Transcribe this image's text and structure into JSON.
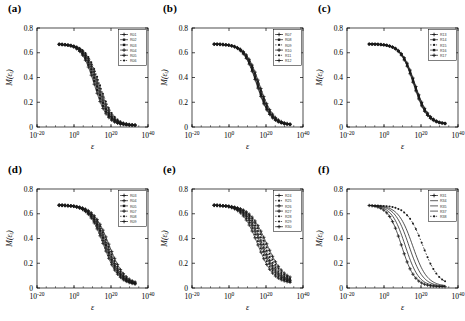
{
  "figure": {
    "background": "#ffffff",
    "axis_color": "#000000",
    "curve_color": "#1a1a1a",
    "panel_count": 6
  },
  "chart_data": [
    {
      "type": "line",
      "panel": "(a)",
      "title": "",
      "xlabel": "ε",
      "ylabel": "M(εᵢ)",
      "xscale": "log",
      "xlim": [
        1e-20,
        1e+40
      ],
      "ylim": [
        0,
        0.8
      ],
      "xticks": [
        1e-20,
        1,
        1e+20,
        1e+40
      ],
      "xticklabels": [
        "10^-20",
        "10^0",
        "10^20",
        "10^40"
      ],
      "yticks": [
        0,
        0.2,
        0.4,
        0.6,
        0.8
      ],
      "yticklabels": [
        "0",
        "0.2",
        "0.4",
        "0.6",
        "0.8"
      ],
      "grid": false,
      "legend_position": "upper right",
      "plateau": 0.67,
      "series": [
        {
          "name": "R01",
          "marker": "plus",
          "midpoint_log10": 11.0,
          "width_log10": 7.0,
          "plateau": 0.672,
          "tail": 0.012
        },
        {
          "name": "R02",
          "marker": "square",
          "midpoint_log10": 11.6,
          "width_log10": 7.1,
          "plateau": 0.67,
          "tail": 0.012
        },
        {
          "name": "R03",
          "marker": "square",
          "midpoint_log10": 12.2,
          "width_log10": 7.2,
          "plateau": 0.671,
          "tail": 0.013
        },
        {
          "name": "R04",
          "marker": "plus",
          "midpoint_log10": 12.8,
          "width_log10": 7.2,
          "plateau": 0.669,
          "tail": 0.013
        },
        {
          "name": "R05",
          "marker": "plus",
          "midpoint_log10": 13.4,
          "width_log10": 7.3,
          "plateau": 0.67,
          "tail": 0.014
        },
        {
          "name": "R06",
          "marker": "dot",
          "midpoint_log10": 14.0,
          "width_log10": 7.4,
          "plateau": 0.668,
          "tail": 0.014
        }
      ]
    },
    {
      "type": "line",
      "panel": "(b)",
      "title": "",
      "xlabel": "ε",
      "ylabel": "M(εᵢ)",
      "xscale": "log",
      "xlim": [
        1e-20,
        1e+40
      ],
      "ylim": [
        0,
        0.8
      ],
      "xticks": [
        1e-20,
        1,
        1e+20,
        1e+40
      ],
      "xticklabels": [
        "10^-20",
        "10^0",
        "10^20",
        "10^40"
      ],
      "yticks": [
        0,
        0.2,
        0.4,
        0.6,
        0.8
      ],
      "yticklabels": [
        "0",
        "0.2",
        "0.4",
        "0.6",
        "0.8"
      ],
      "grid": false,
      "legend_position": "upper right",
      "plateau": 0.67,
      "series": [
        {
          "name": "R07",
          "marker": "plus",
          "midpoint_log10": 15.0,
          "width_log10": 7.4,
          "plateau": 0.672,
          "tail": 0.014
        },
        {
          "name": "R08",
          "marker": "square",
          "midpoint_log10": 15.3,
          "width_log10": 7.4,
          "plateau": 0.671,
          "tail": 0.014
        },
        {
          "name": "R09",
          "marker": "dot",
          "midpoint_log10": 15.6,
          "width_log10": 7.5,
          "plateau": 0.67,
          "tail": 0.015
        },
        {
          "name": "R10",
          "marker": "plus",
          "midpoint_log10": 15.9,
          "width_log10": 7.5,
          "plateau": 0.67,
          "tail": 0.015
        },
        {
          "name": "R11",
          "marker": "dot",
          "midpoint_log10": 16.2,
          "width_log10": 7.5,
          "plateau": 0.669,
          "tail": 0.015
        },
        {
          "name": "R12",
          "marker": "plus",
          "midpoint_log10": 16.5,
          "width_log10": 7.6,
          "plateau": 0.669,
          "tail": 0.016
        }
      ]
    },
    {
      "type": "line",
      "panel": "(c)",
      "title": "",
      "xlabel": "ε",
      "ylabel": "M(εᵢ)",
      "xscale": "log",
      "xlim": [
        1e-20,
        1e+40
      ],
      "ylim": [
        0,
        0.8
      ],
      "xticks": [
        1e-20,
        1,
        1e+20,
        1e+40
      ],
      "xticklabels": [
        "10^-20",
        "10^0",
        "10^20",
        "10^40"
      ],
      "yticks": [
        0,
        0.2,
        0.4,
        0.6,
        0.8
      ],
      "yticklabels": [
        "0",
        "0.2",
        "0.4",
        "0.6",
        "0.8"
      ],
      "grid": false,
      "legend_position": "upper right",
      "plateau": 0.67,
      "series": [
        {
          "name": "R13",
          "marker": "plus",
          "midpoint_log10": 16.0,
          "width_log10": 7.3,
          "plateau": 0.672,
          "tail": 0.02
        },
        {
          "name": "R14",
          "marker": "square",
          "midpoint_log10": 16.2,
          "width_log10": 7.3,
          "plateau": 0.671,
          "tail": 0.021
        },
        {
          "name": "R15",
          "marker": "dot",
          "midpoint_log10": 16.4,
          "width_log10": 7.3,
          "plateau": 0.671,
          "tail": 0.021
        },
        {
          "name": "R16",
          "marker": "square",
          "midpoint_log10": 16.6,
          "width_log10": 7.4,
          "plateau": 0.67,
          "tail": 0.022
        },
        {
          "name": "R17",
          "marker": "plus",
          "midpoint_log10": 16.8,
          "width_log10": 7.4,
          "plateau": 0.67,
          "tail": 0.022
        }
      ]
    },
    {
      "type": "line",
      "panel": "(d)",
      "title": "",
      "xlabel": "ε",
      "ylabel": "M(εᵢ)",
      "xscale": "log",
      "xlim": [
        1e-20,
        1e+40
      ],
      "ylim": [
        0,
        0.8
      ],
      "xticks": [
        1e-20,
        1,
        1e+20,
        1e+40
      ],
      "xticklabels": [
        "10^-20",
        "10^0",
        "10^20",
        "10^40"
      ],
      "yticks": [
        0,
        0.2,
        0.4,
        0.6,
        0.8
      ],
      "yticklabels": [
        "0",
        "0.2",
        "0.4",
        "0.6",
        "0.8"
      ],
      "grid": false,
      "legend_position": "upper right",
      "plateau": 0.67,
      "series": [
        {
          "name": "R03",
          "marker": "plus",
          "midpoint_log10": 16.0,
          "width_log10": 8.2,
          "plateau": 0.672,
          "tail": 0.022
        },
        {
          "name": "R04",
          "marker": "plus",
          "midpoint_log10": 16.6,
          "width_log10": 8.3,
          "plateau": 0.671,
          "tail": 0.023
        },
        {
          "name": "R05",
          "marker": "square",
          "midpoint_log10": 17.2,
          "width_log10": 8.3,
          "plateau": 0.67,
          "tail": 0.024
        },
        {
          "name": "R07",
          "marker": "plus",
          "midpoint_log10": 17.8,
          "width_log10": 8.4,
          "plateau": 0.67,
          "tail": 0.024
        },
        {
          "name": "R08",
          "marker": "dot",
          "midpoint_log10": 18.4,
          "width_log10": 8.4,
          "plateau": 0.669,
          "tail": 0.025
        },
        {
          "name": "R09",
          "marker": "plus",
          "midpoint_log10": 19.0,
          "width_log10": 8.5,
          "plateau": 0.668,
          "tail": 0.026
        }
      ]
    },
    {
      "type": "line",
      "panel": "(e)",
      "title": "",
      "xlabel": "ε",
      "ylabel": "M(εᵢ)",
      "xscale": "log",
      "xlim": [
        1e-20,
        1e+40
      ],
      "ylim": [
        0,
        0.8
      ],
      "xticks": [
        1e-20,
        1,
        1e+20,
        1e+40
      ],
      "xticklabels": [
        "10^-20",
        "10^0",
        "10^20",
        "10^40"
      ],
      "yticks": [
        0,
        0.2,
        0.4,
        0.6,
        0.8
      ],
      "yticklabels": [
        "0",
        "0.2",
        "0.4",
        "0.6",
        "0.8"
      ],
      "grid": false,
      "legend_position": "upper right",
      "plateau": 0.67,
      "series": [
        {
          "name": "R24",
          "marker": "plus",
          "midpoint_log10": 15.5,
          "width_log10": 8.6,
          "plateau": 0.672,
          "tail": 0.035
        },
        {
          "name": "R25",
          "marker": "dot",
          "midpoint_log10": 16.3,
          "width_log10": 8.7,
          "plateau": 0.671,
          "tail": 0.038
        },
        {
          "name": "R26",
          "marker": "plus",
          "midpoint_log10": 17.1,
          "width_log10": 8.8,
          "plateau": 0.671,
          "tail": 0.04
        },
        {
          "name": "R27",
          "marker": "plus",
          "midpoint_log10": 17.9,
          "width_log10": 8.9,
          "plateau": 0.67,
          "tail": 0.043
        },
        {
          "name": "R28",
          "marker": "dot",
          "midpoint_log10": 18.7,
          "width_log10": 9.0,
          "plateau": 0.67,
          "tail": 0.046
        },
        {
          "name": "R29",
          "marker": "dot",
          "midpoint_log10": 19.5,
          "width_log10": 9.1,
          "plateau": 0.669,
          "tail": 0.049
        },
        {
          "name": "R30",
          "marker": "plus",
          "midpoint_log10": 20.3,
          "width_log10": 9.2,
          "plateau": 0.668,
          "tail": 0.052
        }
      ]
    },
    {
      "type": "line",
      "panel": "(f)",
      "title": "",
      "xlabel": "ε",
      "ylabel": "M(εᵢ)",
      "xscale": "log",
      "xlim": [
        1e-20,
        1e+40
      ],
      "ylim": [
        0,
        0.8
      ],
      "xticks": [
        1e-20,
        1,
        1e+20,
        1e+40
      ],
      "xticklabels": [
        "10^-20",
        "10^0",
        "10^20",
        "10^40"
      ],
      "yticks": [
        0,
        0.2,
        0.4,
        0.6,
        0.8
      ],
      "yticklabels": [
        "0",
        "0.2",
        "0.4",
        "0.6",
        "0.8"
      ],
      "grid": false,
      "legend_position": "upper right",
      "plateau": 0.67,
      "series": [
        {
          "name": "R31",
          "marker": "plus",
          "midpoint_log10": 9.5,
          "width_log10": 7.2,
          "plateau": 0.672,
          "tail": 0.01
        },
        {
          "name": "R34",
          "marker": "line",
          "midpoint_log10": 11.5,
          "width_log10": 7.4,
          "plateau": 0.671,
          "tail": 0.011
        },
        {
          "name": "R35",
          "marker": "line",
          "midpoint_log10": 13.5,
          "width_log10": 7.6,
          "plateau": 0.67,
          "tail": 0.012
        },
        {
          "name": "R37",
          "marker": "line",
          "midpoint_log10": 15.5,
          "width_log10": 7.8,
          "plateau": 0.669,
          "tail": 0.013
        },
        {
          "name": "R38",
          "marker": "dot",
          "midpoint_log10": 21.0,
          "width_log10": 8.6,
          "plateau": 0.668,
          "tail": 0.016
        }
      ]
    }
  ]
}
